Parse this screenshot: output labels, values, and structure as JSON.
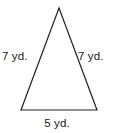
{
  "figure": {
    "type": "isosceles-triangle",
    "shape": {
      "apex": [
        59,
        8
      ],
      "bottom_left": [
        21,
        110
      ],
      "bottom_right": [
        97,
        110
      ],
      "stroke_color": "#222222",
      "stroke_width": 1.2,
      "fill": "none"
    },
    "background_color": "#ffffff",
    "labels": {
      "left_side": "7 yd.",
      "right_side": "7 yd.",
      "base": "5 yd."
    }
  }
}
